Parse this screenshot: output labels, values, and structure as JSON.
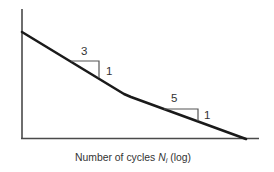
{
  "diagram": {
    "type": "S-N curve (bilinear, log scale)",
    "x_axis": {
      "label_prefix": "Number of cycles ",
      "label_symbol": "N",
      "label_subscript": "i",
      "label_suffix": " (log)"
    },
    "y_axis": {
      "label": ""
    },
    "segments": [
      {
        "name": "first-slope",
        "run": "3",
        "rise": "1"
      },
      {
        "name": "second-slope",
        "run": "5",
        "rise": "1"
      }
    ],
    "colors": {
      "curve": "#1a1a1a",
      "axis": "#4a4a4a",
      "text": "#333333"
    }
  }
}
